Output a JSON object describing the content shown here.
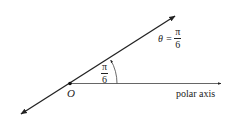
{
  "diagram": {
    "type": "polar-angle-ray",
    "origin_label": "O",
    "ray_label": {
      "lhs": "θ =",
      "numerator": "π",
      "denominator": "6"
    },
    "angle_label": {
      "numerator": "π",
      "denominator": "6"
    },
    "axis_label": "polar axis",
    "colors": {
      "line": "#222222",
      "text": "#222222",
      "background": "#ffffff"
    }
  }
}
